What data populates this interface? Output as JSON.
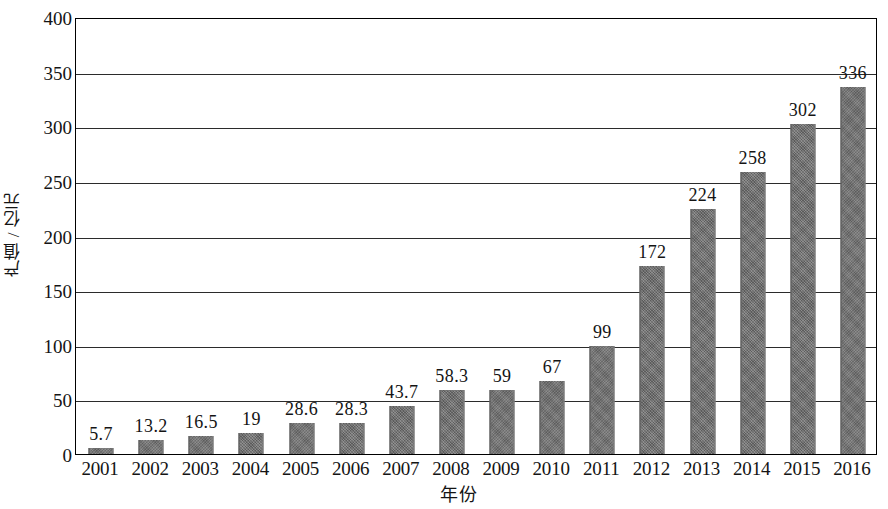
{
  "chart_data": {
    "type": "bar",
    "title": "",
    "xlabel": "年份",
    "ylabel": "产值 / 亿元",
    "ylim": [
      0,
      400
    ],
    "ytick_step": 50,
    "yticks": [
      "0",
      "50",
      "100",
      "150",
      "200",
      "250",
      "300",
      "350",
      "400"
    ],
    "grid": "horizontal",
    "legend": "none",
    "bar_color": "#6e6e6e",
    "categories": [
      "2001",
      "2002",
      "2003",
      "2004",
      "2005",
      "2006",
      "2007",
      "2008",
      "2009",
      "2010",
      "2011",
      "2012",
      "2013",
      "2014",
      "2015",
      "2016"
    ],
    "values": [
      5.7,
      13.2,
      16.5,
      19,
      28.6,
      28.3,
      43.7,
      58.3,
      59,
      67,
      99,
      172,
      224,
      258,
      302,
      336
    ],
    "value_labels": [
      "5.7",
      "13.2",
      "16.5",
      "19",
      "28.6",
      "28.3",
      "43.7",
      "58.3",
      "59",
      "67",
      "99",
      "172",
      "224",
      "258",
      "302",
      "336"
    ]
  }
}
